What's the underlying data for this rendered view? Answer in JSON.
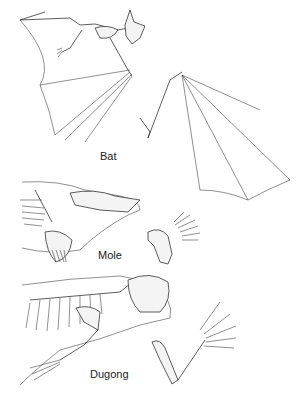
{
  "figure": {
    "panels": [
      {
        "id": "bat",
        "label": "Bat"
      },
      {
        "id": "mole",
        "label": "Mole"
      },
      {
        "id": "dugong",
        "label": "Dugong"
      }
    ]
  }
}
